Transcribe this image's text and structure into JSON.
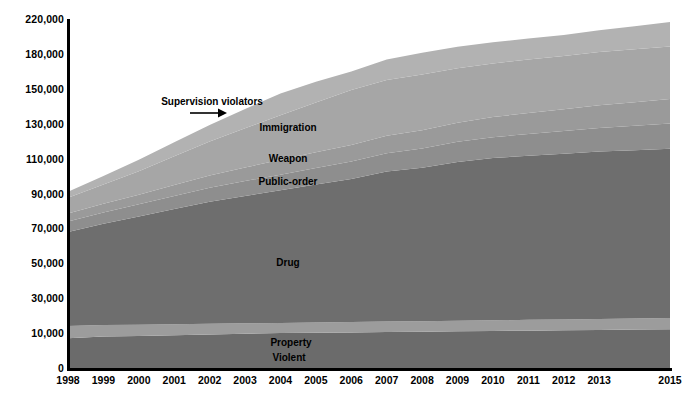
{
  "chart_data": {
    "type": "area",
    "title": "",
    "subtitle": "",
    "xlabel": "",
    "ylabel": "",
    "grid": false,
    "legend_position": "inline-labels",
    "stacked": true,
    "x": [
      "1998",
      "1999",
      "2000",
      "2001",
      "2002",
      "2003",
      "2004",
      "2005",
      "2006",
      "2007",
      "2008",
      "2009",
      "2010",
      "2011",
      "2012",
      "2013",
      "2014",
      "2015"
    ],
    "xtick_labels": [
      "1998",
      "1999",
      "2000",
      "2001",
      "2002",
      "2003",
      "2004",
      "2005",
      "2006",
      "2007",
      "2008",
      "2009",
      "2010",
      "2011",
      "2012",
      "2013",
      "2015"
    ],
    "ytick_labels": [
      "0",
      "10,000",
      "30,000",
      "50,000",
      "70,000",
      "90,000",
      "110,000",
      "130,000",
      "150,000",
      "180,000",
      "220,000"
    ],
    "ytick_values": [
      0,
      10000,
      30000,
      50000,
      70000,
      90000,
      110000,
      130000,
      150000,
      180000,
      220000
    ],
    "ylim": [
      0,
      220000
    ],
    "series": [
      {
        "name": "Violent",
        "color": "#6b6b6b",
        "values": [
          8500,
          9000,
          9200,
          9400,
          9600,
          9800,
          10000,
          10200,
          10400,
          10600,
          10800,
          11000,
          11200,
          11400,
          11600,
          11800,
          12000,
          12200
        ]
      },
      {
        "name": "Property",
        "color": "#9c9c9c",
        "values": [
          5500,
          5600,
          5600,
          5700,
          5700,
          5800,
          5800,
          5900,
          5900,
          6000,
          6000,
          6100,
          6100,
          6200,
          6200,
          6300,
          6300,
          6400
        ]
      },
      {
        "name": "Drug",
        "color": "#6e6e6e",
        "values": [
          54000,
          58000,
          62000,
          66000,
          70000,
          73000,
          76000,
          79000,
          82000,
          86000,
          88000,
          91000,
          93000,
          94000,
          95000,
          96000,
          96500,
          97000
        ]
      },
      {
        "name": "Public-order",
        "color": "#8e8e8e",
        "values": [
          6000,
          6500,
          7000,
          7500,
          8000,
          8500,
          9000,
          9500,
          10000,
          10500,
          11000,
          11500,
          12000,
          12500,
          13000,
          13500,
          14000,
          14500
        ]
      },
      {
        "name": "Weapon",
        "color": "#9a9a9a",
        "values": [
          4500,
          5000,
          5500,
          6200,
          7000,
          7800,
          8500,
          9000,
          9500,
          10000,
          10500,
          11000,
          11500,
          12000,
          12500,
          13000,
          13500,
          14000
        ]
      },
      {
        "name": "Immigration",
        "color": "#a6a6a6",
        "values": [
          9000,
          11000,
          13500,
          16500,
          19500,
          22500,
          25500,
          28500,
          31500,
          34500,
          36000,
          37000,
          38000,
          39000,
          40000,
          41500,
          43000,
          44500
        ]
      },
      {
        "name": "Supervision violators",
        "color": "#b2b2b2",
        "values": [
          3500,
          5000,
          6500,
          8000,
          9500,
          11000,
          12500,
          14000,
          15500,
          17500,
          19000,
          20500,
          21500,
          22500,
          23500,
          25000,
          26500,
          28000
        ]
      }
    ],
    "annotations": [
      {
        "text": "Supervision violators",
        "kind": "callout-with-arrow",
        "x_px": 212,
        "y_px": 96
      },
      {
        "text": "Immigration",
        "kind": "inline-series-label",
        "x_px": 288,
        "y_px": 127
      },
      {
        "text": "Weapon",
        "kind": "inline-series-label",
        "x_px": 288,
        "y_px": 158
      },
      {
        "text": "Public-order",
        "kind": "inline-series-label",
        "x_px": 288,
        "y_px": 181
      },
      {
        "text": "Drug",
        "kind": "inline-series-label",
        "x_px": 288,
        "y_px": 262
      },
      {
        "text": "Property",
        "kind": "inline-series-label",
        "x_px": 291,
        "y_px": 342
      },
      {
        "text": "Violent",
        "kind": "inline-series-label",
        "x_px": 289,
        "y_px": 357
      }
    ],
    "axis_color": "#000000",
    "background_color": "#ffffff"
  }
}
